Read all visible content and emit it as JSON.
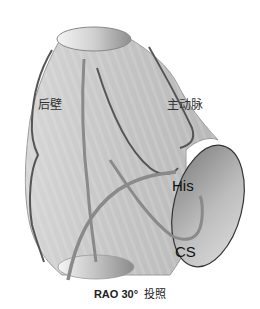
{
  "figure": {
    "view": "RAO 30° view",
    "caption": {
      "projection": "RAO 30°",
      "suffix": "投照"
    },
    "labels": {
      "posterior_wall": "后壁",
      "aorta": "主动脉",
      "his": "His",
      "cs": "CS"
    },
    "colors": {
      "body_fill": "#c8c8c8",
      "body_light": "#e2e2e2",
      "outline": "#555555",
      "catheter_dark": "#555555",
      "catheter_gray": "#8a8a8a",
      "ellipse_dark": "#8c8c8c"
    }
  }
}
